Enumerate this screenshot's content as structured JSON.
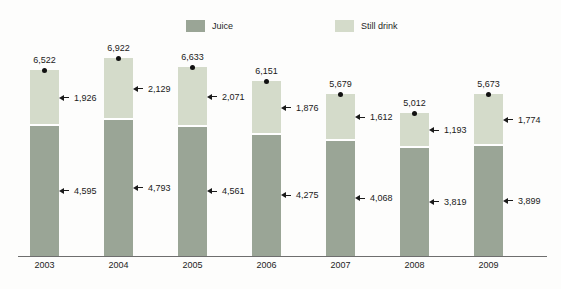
{
  "chart_data": {
    "type": "bar",
    "stacked": true,
    "title": "",
    "xlabel": "",
    "ylabel": "",
    "categories": [
      "2003",
      "2004",
      "2005",
      "2006",
      "2007",
      "2008",
      "2009"
    ],
    "series": [
      {
        "name": "Juice",
        "color": "#9aa596",
        "values": [
          4595,
          4793,
          4561,
          4275,
          4068,
          3819,
          3899
        ]
      },
      {
        "name": "Still drink",
        "color": "#d4dbca",
        "values": [
          1926,
          2129,
          2071,
          1876,
          1612,
          1193,
          1774
        ]
      }
    ],
    "totals": [
      6522,
      6922,
      6633,
      6151,
      5679,
      5012,
      5673
    ],
    "ylim": [
      0,
      7000
    ],
    "grid": false,
    "legend_position": "top",
    "value_label_format": "thousands-comma",
    "annotations": "total value with dot marker above each bar; each segment labeled at right with left-pointing arrow"
  },
  "colors": {
    "background": "#fdfdfc",
    "axis": "#6e6e6e",
    "label_text": "#1a1a1a",
    "marker_dot": "#111111",
    "segment_divider": "#ffffff"
  }
}
